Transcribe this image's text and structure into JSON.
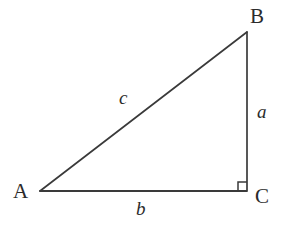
{
  "figure": {
    "kind": "geometry-diagram",
    "background_color": "#ffffff",
    "stroke_color": "#3a3a3a",
    "text_color": "#2b2b2b",
    "width": 287,
    "height": 228
  },
  "vertices": {
    "A": {
      "label": "A",
      "x": 40,
      "y": 191
    },
    "B": {
      "label": "B",
      "x": 247,
      "y": 32
    },
    "C": {
      "label": "C",
      "x": 247,
      "y": 190
    }
  },
  "sides": {
    "a": {
      "label": "a",
      "from": "B",
      "to": "C",
      "description": "vertical leg opposite vertex A"
    },
    "b": {
      "label": "b",
      "from": "A",
      "to": "C",
      "description": "horizontal leg opposite vertex B"
    },
    "c": {
      "label": "c",
      "from": "A",
      "to": "B",
      "description": "hypotenuse opposite vertex C"
    }
  },
  "right_angle": {
    "at_vertex": "C",
    "marker": "square",
    "size": 9
  }
}
